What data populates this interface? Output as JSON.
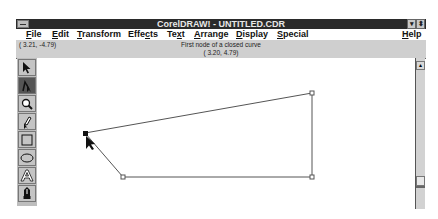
{
  "window": {
    "title": "CorelDRAW! - UNTITLED.CDR",
    "minimize_glyph": "▾",
    "restore_glyph": "⬍"
  },
  "menu": {
    "items": [
      {
        "label": "File",
        "underline": "F",
        "rest": "ile"
      },
      {
        "label": "Edit",
        "underline": "E",
        "rest": "dit"
      },
      {
        "label": "Transform",
        "underline": "T",
        "rest": "ransform"
      },
      {
        "label": "Effects",
        "pre": "Effe",
        "underline": "c",
        "rest": "ts"
      },
      {
        "label": "Text",
        "pre": "Te",
        "underline": "x",
        "rest": "t"
      },
      {
        "label": "Arrange",
        "underline": "A",
        "rest": "rrange"
      },
      {
        "label": "Display",
        "underline": "D",
        "rest": "isplay"
      },
      {
        "label": "Special",
        "underline": "S",
        "rest": "pecial"
      },
      {
        "label": "Help",
        "underline": "H",
        "rest": "elp"
      }
    ]
  },
  "status": {
    "cursor_coords": "( 3.21, -4.79)",
    "message_line1": "First node of a closed curve",
    "message_line2": "( 3.20, 4.79)"
  },
  "toolbox": {
    "tools": [
      {
        "name": "pick-tool",
        "icon": "arrow-icon",
        "active": false
      },
      {
        "name": "shape-tool",
        "icon": "node-edit-icon",
        "active": true
      },
      {
        "name": "zoom-tool",
        "icon": "magnifier-icon",
        "active": false
      },
      {
        "name": "pencil-tool",
        "icon": "pencil-icon",
        "active": false
      },
      {
        "name": "rectangle-tool",
        "icon": "rectangle-icon",
        "active": false
      },
      {
        "name": "ellipse-tool",
        "icon": "ellipse-icon",
        "active": false
      },
      {
        "name": "text-tool",
        "icon": "letter-a-icon",
        "active": false
      },
      {
        "name": "outline-tool",
        "icon": "pen-nib-icon",
        "active": false
      }
    ]
  },
  "canvas": {
    "shape": "closed-curve",
    "nodes": [
      [
        85,
        133
      ],
      [
        312,
        93
      ],
      [
        312,
        177
      ],
      [
        123,
        177
      ]
    ],
    "selected_node": 0,
    "line_color": "#555555"
  },
  "scrollbar": {
    "up_glyph": "▴"
  }
}
